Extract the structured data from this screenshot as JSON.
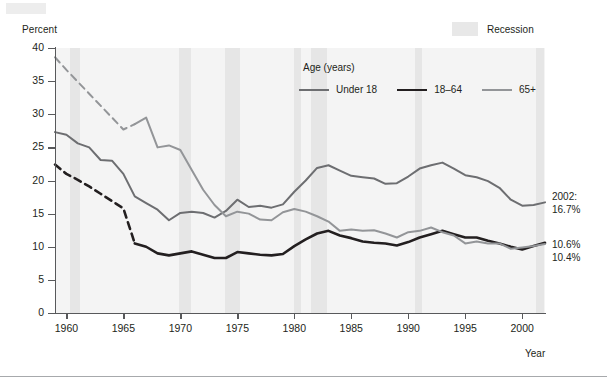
{
  "axis": {
    "ylabel": "Percent",
    "xlabel": "Year",
    "yticks": [
      "0",
      "5",
      "10",
      "15",
      "20",
      "25",
      "30",
      "35",
      "40"
    ],
    "xticks": [
      "1960",
      "1965",
      "1970",
      "1975",
      "1980",
      "1985",
      "1990",
      "1995",
      "2000"
    ]
  },
  "recession_legend": {
    "label": "Recession",
    "color": "#e8e8e8"
  },
  "legend": {
    "title": "Age (years)",
    "items": [
      {
        "label": "Under 18",
        "color": "#6d6e71",
        "width": 2.0,
        "icon": "line-swatch"
      },
      {
        "label": "18–64",
        "color": "#231f20",
        "width": 2.6,
        "icon": "line-swatch"
      },
      {
        "label": "65+",
        "color": "#939598",
        "width": 2.0,
        "icon": "line-swatch"
      }
    ]
  },
  "annotations": [
    {
      "lines": [
        "2002:",
        "16.7%"
      ]
    },
    {
      "lines": [
        "10.6%",
        "10.4%"
      ]
    }
  ],
  "chart_data": {
    "type": "line",
    "title": "",
    "subtitle": "",
    "xlabel": "Year",
    "ylabel": "Percent",
    "xlim": [
      1959,
      2002
    ],
    "ylim": [
      0,
      40
    ],
    "grid": false,
    "legend_position": "inside-top-center",
    "legend_title": "Age (years)",
    "annotations": [
      {
        "text": "2002: 16.7%",
        "series": "Under 18",
        "x": 2002,
        "y": 16.7
      },
      {
        "text": "10.6%",
        "series": "65+",
        "x": 2002,
        "y": 10.4
      },
      {
        "text": "10.4%",
        "series": "18–64",
        "x": 2002,
        "y": 10.6
      }
    ],
    "shaded_regions": {
      "label": "Recession",
      "color": "#e6e6e6",
      "spans": [
        [
          1960.3,
          1961.2
        ],
        [
          1969.9,
          1970.9
        ],
        [
          1973.9,
          1975.2
        ],
        [
          1980.0,
          1980.6
        ],
        [
          1981.5,
          1982.9
        ],
        [
          1990.6,
          1991.2
        ],
        [
          2001.2,
          2001.9
        ]
      ]
    },
    "x": [
      1959,
      1960,
      1961,
      1962,
      1963,
      1964,
      1965,
      1966,
      1967,
      1968,
      1969,
      1970,
      1971,
      1972,
      1973,
      1974,
      1975,
      1976,
      1977,
      1978,
      1979,
      1980,
      1981,
      1982,
      1983,
      1984,
      1985,
      1986,
      1987,
      1988,
      1989,
      1990,
      1991,
      1992,
      1993,
      1994,
      1995,
      1996,
      1997,
      1998,
      1999,
      2000,
      2001,
      2002
    ],
    "series": [
      {
        "name": "Under 18",
        "color": "#6d6e71",
        "dashed_until": null,
        "values": [
          27.3,
          26.9,
          25.6,
          25.0,
          23.1,
          23.0,
          21.0,
          17.6,
          16.6,
          15.6,
          14.0,
          15.1,
          15.3,
          15.1,
          14.4,
          15.4,
          17.1,
          16.0,
          16.2,
          15.9,
          16.4,
          18.3,
          20.0,
          21.9,
          22.3,
          21.5,
          20.7,
          20.5,
          20.3,
          19.5,
          19.6,
          20.6,
          21.8,
          22.3,
          22.7,
          21.8,
          20.8,
          20.5,
          19.9,
          18.9,
          17.1,
          16.2,
          16.3,
          16.7
        ]
      },
      {
        "name": "18–64",
        "color": "#231f20",
        "dashed_until": 1966,
        "values": [
          22.4,
          21.0,
          20.1,
          19.1,
          18.0,
          16.9,
          15.8,
          10.5,
          10.0,
          9.0,
          8.7,
          9.0,
          9.3,
          8.8,
          8.3,
          8.3,
          9.2,
          9.0,
          8.8,
          8.7,
          8.9,
          10.1,
          11.1,
          12.0,
          12.4,
          11.7,
          11.3,
          10.8,
          10.6,
          10.5,
          10.2,
          10.7,
          11.4,
          11.9,
          12.4,
          11.9,
          11.4,
          11.4,
          10.9,
          10.5,
          10.0,
          9.6,
          10.1,
          10.6
        ]
      },
      {
        "name": "65+",
        "color": "#939598",
        "dashed_until": 1966,
        "values": [
          38.6,
          36.7,
          34.9,
          33.1,
          31.3,
          29.5,
          27.7,
          28.5,
          29.5,
          25.0,
          25.3,
          24.6,
          21.6,
          18.6,
          16.3,
          14.6,
          15.3,
          15.0,
          14.1,
          14.0,
          15.2,
          15.7,
          15.3,
          14.6,
          13.8,
          12.4,
          12.6,
          12.4,
          12.5,
          12.0,
          11.4,
          12.2,
          12.4,
          12.9,
          12.2,
          11.7,
          10.5,
          10.8,
          10.5,
          10.5,
          9.7,
          9.9,
          10.1,
          10.4
        ]
      }
    ]
  }
}
